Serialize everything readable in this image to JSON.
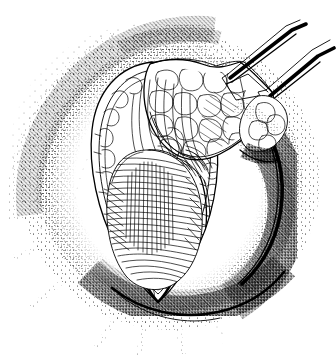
{
  "figure": {
    "title": "Surgical exposure of subareolar lesion through curvilinear incision",
    "kind": "pen-and-ink stipple medical illustration",
    "caption": "",
    "has_text_labels": false,
    "colors": {
      "ink": "#000000",
      "paper": "#ffffff",
      "shadow": "#000000"
    },
    "canvas": {
      "width": 336,
      "height": 362
    },
    "elements": [
      {
        "name": "breast-mound",
        "label": "Rounded body surface (breast mound)",
        "description": "Large sphere rendered with stipple shading, dark crescent shadow on right and lower-right margin",
        "center_x": 168,
        "center_y": 182,
        "radius": 132
      },
      {
        "name": "incision-opening",
        "label": "Leaf-shaped incision opening",
        "description": "Almond / leaf shaped wound retracted open, pointed inferiorly, widest superiorly",
        "top_y": 62,
        "bottom_y": 300,
        "left_x": 88,
        "right_x": 218
      },
      {
        "name": "tissue-flap",
        "label": "Retracted fibrofatty tissue flap",
        "description": "Cobblestone fat lobules with fibrous septa, lifted superiorly and to the right"
      },
      {
        "name": "exposed-mass",
        "label": "Exposed lesion / glandular mass",
        "description": "Ovoid mass with dense horizontal fiber striations filling lower incision"
      },
      {
        "name": "forceps-upper",
        "label": "Upper surgical forceps",
        "description": "Straight forceps entering from upper right, grasping the flap apex"
      },
      {
        "name": "forceps-lower",
        "label": "Lower surgical forceps",
        "description": "Second forceps entering from right, grasping the lateral flap edge"
      },
      {
        "name": "stipple-halo",
        "label": "Radiating stipple shading",
        "description": "Dot shading forming circular halo around the operative field"
      }
    ]
  }
}
